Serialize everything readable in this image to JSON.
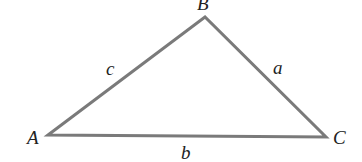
{
  "diagram": {
    "type": "triangle",
    "stroke_color": "#7a7a7a",
    "vertices": [
      {
        "label": "A",
        "x": 48,
        "y": 135
      },
      {
        "label": "B",
        "x": 205,
        "y": 17
      },
      {
        "label": "C",
        "x": 326,
        "y": 137
      }
    ],
    "sides": [
      {
        "label": "c",
        "from": "A",
        "to": "B"
      },
      {
        "label": "a",
        "from": "B",
        "to": "C"
      },
      {
        "label": "b",
        "from": "A",
        "to": "C"
      }
    ]
  }
}
